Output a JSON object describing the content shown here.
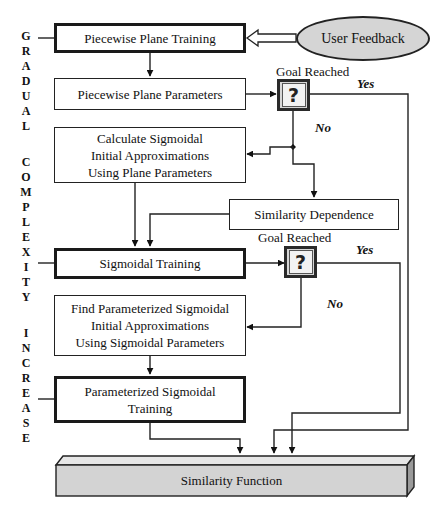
{
  "side_label": {
    "letters": [
      "G",
      "R",
      "A",
      "D",
      "U",
      "A",
      "L",
      "",
      "C",
      "O",
      "M",
      "P",
      "L",
      "E",
      "X",
      "I",
      "T",
      "Y",
      "",
      "I",
      "N",
      "C",
      "R",
      "E",
      "A",
      "S",
      "E"
    ],
    "text": "GRADUAL COMPLEXITY INCREASE"
  },
  "nodes": {
    "piecewise_plane_training": "Piecewise Plane Training",
    "user_feedback": "User Feedback",
    "piecewise_plane_parameters": "Piecewise Plane Parameters",
    "calculate_sigmoidal": [
      "Calculate Sigmoidal",
      "Initial Approximations",
      "Using Plane Parameters"
    ],
    "similarity_dependence": "Similarity Dependence",
    "sigmoidal_training": "Sigmoidal Training",
    "find_parameterized": [
      "Find Parameterized Sigmoidal",
      "Initial Approximations",
      "Using Sigmoidal Parameters"
    ],
    "parameterized_training": [
      "Parameterized Sigmoidal",
      "Training"
    ],
    "similarity_function": "Similarity Function"
  },
  "decisions": [
    {
      "title": "Goal Reached",
      "symbol": "?",
      "yes": "Yes",
      "no": "No"
    },
    {
      "title": "Goal Reached",
      "symbol": "?",
      "yes": "Yes",
      "no": "No"
    }
  ],
  "colors": {
    "line": "#222222",
    "ellipse_fill": "#d5d5d5",
    "function_fill": "#d3d3d3",
    "function_top": "#e6e6e6",
    "function_side": "#9a9a9a"
  }
}
